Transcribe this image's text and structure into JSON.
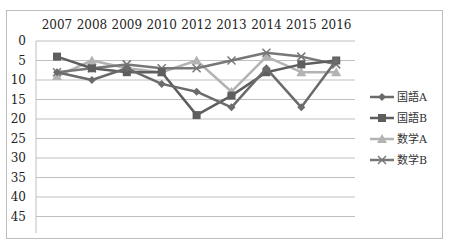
{
  "chart_data": {
    "type": "line",
    "title": "",
    "xlabel": "",
    "ylabel": "",
    "categories": [
      "2007",
      "2008",
      "2009",
      "2010",
      "2012",
      "2013",
      "2014",
      "2015",
      "2016"
    ],
    "y_ticks": [
      0,
      5,
      10,
      15,
      20,
      25,
      30,
      35,
      40,
      45
    ],
    "ylim": [
      0,
      45
    ],
    "y_inverted": true,
    "x_axis_position": "top",
    "grid": true,
    "legend_position": "right",
    "series": [
      {
        "name": "国語A",
        "marker": "diamond",
        "color": "#6b6b6b",
        "values": [
          8,
          10,
          7,
          11,
          13,
          17,
          7,
          17,
          5
        ]
      },
      {
        "name": "国語B",
        "marker": "square",
        "color": "#5e5e5e",
        "values": [
          4,
          7,
          8,
          8,
          19,
          14,
          8,
          6,
          5
        ]
      },
      {
        "name": "数学A",
        "marker": "triangle",
        "color": "#b3b3b3",
        "values": [
          9,
          5,
          7,
          8,
          5,
          13,
          4,
          8,
          8
        ]
      },
      {
        "name": "数学B",
        "marker": "x",
        "color": "#777777",
        "values": [
          8,
          7,
          6,
          7,
          7,
          5,
          3,
          4,
          6
        ]
      }
    ]
  }
}
